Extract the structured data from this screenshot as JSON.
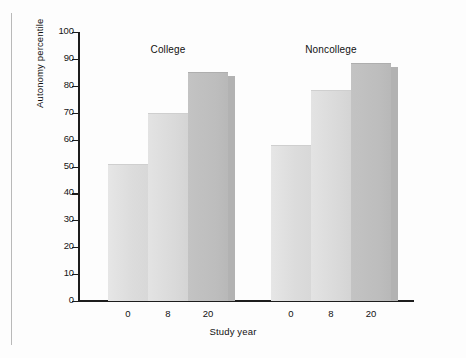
{
  "chart_data": {
    "type": "bar",
    "title": "",
    "xlabel": "Study year",
    "ylabel": "Autonomy percentile",
    "ylim": [
      0,
      100
    ],
    "yticks": [
      0,
      10,
      20,
      30,
      40,
      50,
      60,
      70,
      80,
      90,
      100
    ],
    "ytick_labels": [
      "0",
      "10",
      "20",
      "30",
      "40",
      "50",
      "60",
      "70",
      "80",
      "90",
      "100"
    ],
    "categories": [
      "0",
      "8",
      "20"
    ],
    "grid": false,
    "legend": "none",
    "group_labels": [
      "College",
      "Noncollege"
    ],
    "groups": [
      {
        "name": "College",
        "x": [
          "0",
          "8",
          "20"
        ],
        "values": [
          51,
          70,
          85
        ],
        "styles": [
          "light",
          "light",
          "dark-3d"
        ]
      },
      {
        "name": "Noncollege",
        "x": [
          "0",
          "8",
          "20"
        ],
        "values": [
          58,
          78.5,
          88.5
        ],
        "styles": [
          "light",
          "light",
          "dark-3d"
        ]
      }
    ],
    "colors": {
      "bar_light": "#dcdcdc",
      "bar_dark": "#bdbdbd",
      "bar_side": "#b2b2b2",
      "axis": "#1d1d1d",
      "text": "#111111",
      "background": "#fdfdfd"
    }
  }
}
